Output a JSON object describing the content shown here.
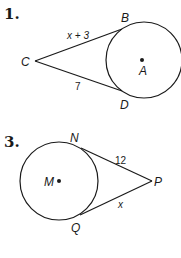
{
  "problems": [
    {
      "number": "1.",
      "points": {
        "external": "C",
        "tangent_top": "B",
        "tangent_bottom": "D",
        "center": "A"
      },
      "segments": {
        "CB": "x + 3",
        "CD": "7"
      }
    },
    {
      "number": "3.",
      "points": {
        "external": "P",
        "tangent_top": "N",
        "tangent_bottom": "Q",
        "center": "M"
      },
      "segments": {
        "NP": "12",
        "PQ": "x"
      }
    }
  ],
  "colors": {
    "ink": "#1a1a1a",
    "background": "#ffffff"
  }
}
